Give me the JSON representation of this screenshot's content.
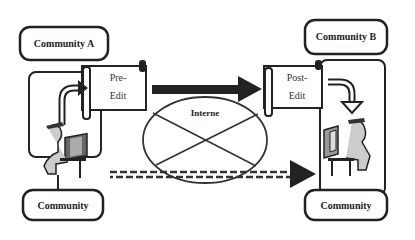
{
  "diagram": {
    "community_a": {
      "label": "Community A"
    },
    "community_b": {
      "label": "Community B"
    },
    "community_a_bottom": {
      "label": "Community"
    },
    "community_b_bottom": {
      "label": "Community"
    },
    "pre_edit": {
      "line1": "Pre-",
      "line2": "Edit"
    },
    "post_edit": {
      "line1": "Post-",
      "line2": "Edit"
    },
    "internet": {
      "label": "Interne"
    }
  }
}
